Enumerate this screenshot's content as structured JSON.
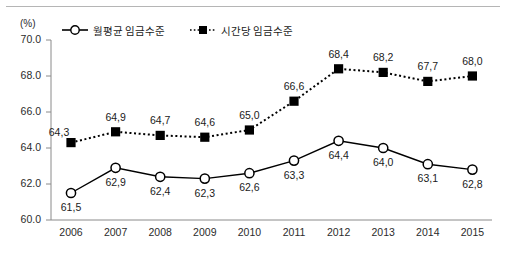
{
  "chart_data": {
    "type": "line",
    "title": "",
    "subtitle": "",
    "xlabel": "",
    "ylabel": "(%)",
    "unit_label": "(%)",
    "categories": [
      "2006",
      "2007",
      "2008",
      "2009",
      "2010",
      "2011",
      "2012",
      "2013",
      "2014",
      "2015"
    ],
    "ylim": [
      60.0,
      70.0
    ],
    "ytick_step": 2.0,
    "ytick_labels": [
      "70.0",
      "68.0",
      "66.0",
      "64.0",
      "62.0",
      "60.0"
    ],
    "ytick_values": [
      70.0,
      68.0,
      66.0,
      64.0,
      62.0,
      60.0
    ],
    "grid": false,
    "legend_position": "top",
    "series": [
      {
        "name": "월평균 임금수준",
        "marker": "circle-open",
        "line_style": "solid",
        "color": "#000000",
        "values": [
          61.5,
          62.9,
          62.4,
          62.3,
          62.6,
          63.3,
          64.4,
          64.0,
          63.1,
          62.8
        ],
        "labels": [
          "61,5",
          "62,9",
          "62,4",
          "62,3",
          "62,6",
          "63,3",
          "64,4",
          "64,0",
          "63,1",
          "62,8"
        ],
        "label_side": [
          "below",
          "below",
          "below",
          "below",
          "below",
          "below",
          "below",
          "below",
          "below",
          "below"
        ]
      },
      {
        "name": "시간당 임금수준",
        "marker": "square-filled",
        "line_style": "dotted",
        "color": "#000000",
        "values": [
          64.3,
          64.9,
          64.7,
          64.6,
          65.0,
          66.6,
          68.4,
          68.2,
          67.7,
          68.0
        ],
        "labels": [
          "64,3",
          "64,9",
          "64,7",
          "64,6",
          "65,0",
          "66,6",
          "68,4",
          "68,2",
          "67,7",
          "68,0"
        ],
        "label_side": [
          "left-above",
          "above",
          "above",
          "above",
          "above",
          "above",
          "above",
          "above",
          "above",
          "above"
        ]
      }
    ]
  }
}
